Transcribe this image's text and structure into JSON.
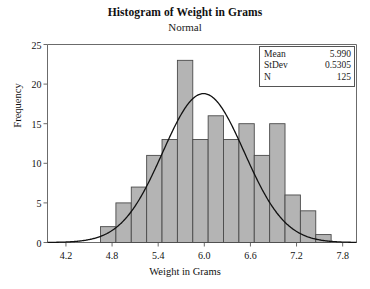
{
  "chart_data": {
    "type": "bar",
    "title": "Histogram of Weight in Grams",
    "subtitle": "Normal",
    "xlabel": "Weight in Grams",
    "ylabel": "Frequency",
    "xlim": [
      3.96,
      7.98
    ],
    "ylim": [
      0,
      25
    ],
    "grid": false,
    "legend_position": "top-right",
    "bin_width": 0.2,
    "bin_starts": [
      4.65,
      4.85,
      5.05,
      5.25,
      5.45,
      5.65,
      5.85,
      6.05,
      6.25,
      6.45,
      6.65,
      6.85,
      7.05,
      7.25,
      7.45
    ],
    "bin_centers": [
      4.75,
      4.95,
      5.15,
      5.35,
      5.55,
      5.75,
      5.95,
      6.15,
      6.35,
      6.55,
      6.75,
      6.95,
      7.15,
      7.35,
      7.55
    ],
    "categories": [
      "4.75",
      "4.95",
      "5.15",
      "5.35",
      "5.55",
      "5.75",
      "5.95",
      "6.15",
      "6.35",
      "6.55",
      "6.75",
      "6.95",
      "7.15",
      "7.35",
      "7.55"
    ],
    "values": [
      2,
      5,
      7,
      11,
      13,
      23,
      13,
      16,
      13,
      15,
      11,
      15,
      6,
      4,
      1
    ],
    "xticks": [
      4.2,
      4.8,
      5.4,
      6.0,
      6.6,
      7.2,
      7.8
    ],
    "xtick_labels": [
      "4.2",
      "4.8",
      "5.4",
      "6.0",
      "6.6",
      "7.2",
      "7.8"
    ],
    "yticks": [
      0,
      5,
      10,
      15,
      20,
      25
    ],
    "ytick_labels": [
      "0",
      "5",
      "10",
      "15",
      "20",
      "25"
    ],
    "overlay": {
      "type": "line",
      "name": "normal-curve",
      "distribution": "Normal",
      "mean": 5.99,
      "stdev": 0.5305,
      "n": 125,
      "scale": "n * bin_width"
    },
    "bar_fill": "#b4b4b4",
    "bar_edge": "#4a4a4a",
    "curve_color": "#111111",
    "axis_color": "#6b6b6b"
  },
  "legend": {
    "rows": [
      {
        "key": "Mean",
        "value": "5.990"
      },
      {
        "key": "StDev",
        "value": "0.5305"
      },
      {
        "key": "N",
        "value": "125"
      }
    ]
  }
}
